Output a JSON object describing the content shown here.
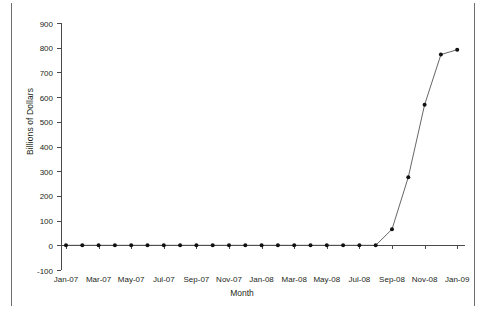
{
  "chart_data": {
    "type": "line",
    "title": "",
    "xlabel": "Month",
    "ylabel": "Billions of Dollars",
    "ylim": [
      -100,
      900
    ],
    "yticks": [
      -100,
      0,
      100,
      200,
      300,
      400,
      500,
      600,
      700,
      800,
      900
    ],
    "ytick_labels": [
      "-100",
      "0",
      "100",
      "200",
      "300",
      "400",
      "500",
      "600",
      "700",
      "800",
      "900"
    ],
    "xtick_labels": [
      "Jan-07",
      "Mar-07",
      "May-07",
      "Jul-07",
      "Sep-07",
      "Nov-07",
      "Jan-08",
      "Mar-08",
      "May-08",
      "Jul-08",
      "Sep-08",
      "Nov-08",
      "Jan-09"
    ],
    "grid": false,
    "legend": false,
    "marker": "filled-circle",
    "line_color": "#555555",
    "marker_color": "#111111",
    "categories": [
      "Jan-07",
      "Feb-07",
      "Mar-07",
      "Apr-07",
      "May-07",
      "Jun-07",
      "Jul-07",
      "Aug-07",
      "Sep-07",
      "Oct-07",
      "Nov-07",
      "Dec-07",
      "Jan-08",
      "Feb-08",
      "Mar-08",
      "Apr-08",
      "May-08",
      "Jun-08",
      "Jul-08",
      "Aug-08",
      "Sep-08",
      "Oct-08",
      "Nov-08",
      "Dec-08",
      "Jan-09"
    ],
    "values": [
      0,
      0,
      0,
      0,
      0,
      0,
      0,
      0,
      0,
      0,
      0,
      0,
      0,
      0,
      0,
      0,
      0,
      0,
      0,
      0,
      65,
      276,
      569,
      772,
      792
    ]
  }
}
